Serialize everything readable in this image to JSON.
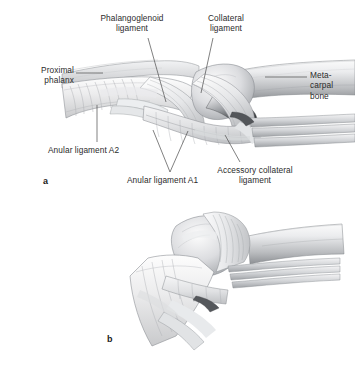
{
  "figure": {
    "background_color": "#ffffff",
    "label_color": "#2b2b2b",
    "illustration_style": "grayscale pencil anatomical drawing",
    "panels": [
      {
        "letter": "a",
        "view": "extended joint, lateral view with labels"
      },
      {
        "letter": "b",
        "view": "flexed joint, lateral view unlabeled"
      }
    ]
  },
  "labels": {
    "phalangoglenoid": "Phalangoglenoid\nligament",
    "collateral": "Collateral\nligament",
    "proximal_phalanx": "Proximal\nphalanx",
    "metacarpal_bone": "Meta-\ncarpal\nbone",
    "anular_a2": "Anular ligament A2",
    "anular_a1": "Anular ligament A1",
    "accessory_collateral": "Accessory collateral\nligament"
  },
  "panel_letters": {
    "a": "a",
    "b": "b"
  }
}
